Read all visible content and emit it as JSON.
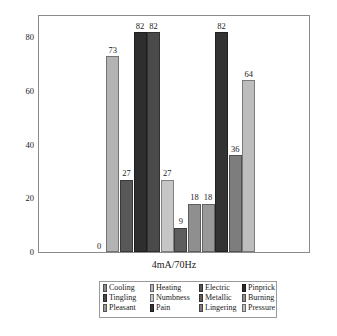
{
  "chart_data": {
    "type": "bar",
    "title": "",
    "subtitle": "",
    "xlabel": "4mA/70Hz",
    "ylabel": "Percentage",
    "categories": [
      "4mA/70Hz"
    ],
    "ylim": [
      0,
      88
    ],
    "yticks": [
      0,
      20,
      40,
      60,
      80
    ],
    "ytick_labels": [
      "0",
      "20",
      "40",
      "60",
      "80"
    ],
    "grid": false,
    "legend_position": "bottom",
    "legend_columns": 4,
    "legend_rows": 3,
    "series": [
      {
        "name": "Cooling",
        "values": [
          0
        ],
        "label": "0",
        "color": "#8c8c8c"
      },
      {
        "name": "Heating",
        "values": [
          73
        ],
        "label": "73",
        "color": "#b3b3b3"
      },
      {
        "name": "Electric",
        "values": [
          27
        ],
        "label": "27",
        "color": "#585858"
      },
      {
        "name": "Pinprick",
        "values": [
          82
        ],
        "label": "82",
        "color": "#2e2e2e"
      },
      {
        "name": "Tingling",
        "values": [
          82
        ],
        "label": "82",
        "color": "#4a4a4a"
      },
      {
        "name": "Numbness",
        "values": [
          27
        ],
        "label": "27",
        "color": "#c6c6c6"
      },
      {
        "name": "Metallic",
        "values": [
          9
        ],
        "label": "9",
        "color": "#5e5e5e"
      },
      {
        "name": "Burning",
        "values": [
          18
        ],
        "label": "18",
        "color": "#8f8f8f"
      },
      {
        "name": "Pleasant",
        "values": [
          18
        ],
        "label": "18",
        "color": "#999999"
      },
      {
        "name": "Pain",
        "values": [
          82
        ],
        "label": "82",
        "color": "#333333"
      },
      {
        "name": "Lingering",
        "values": [
          36
        ],
        "label": "36",
        "color": "#7d7d7d"
      },
      {
        "name": "Pressure",
        "values": [
          64
        ],
        "label": "64",
        "color": "#bdbdbd"
      }
    ]
  },
  "axes": {
    "ylabel": "Percentage",
    "xlabel": "4mA/70Hz",
    "yticks": [
      "0",
      "20",
      "40",
      "60",
      "80"
    ]
  },
  "legend": {
    "rows": [
      [
        {
          "label": "Cooling",
          "color": "#8c8c8c"
        },
        {
          "label": "Heating",
          "color": "#b3b3b3"
        },
        {
          "label": "Electric",
          "color": "#585858"
        },
        {
          "label": "Pinprick",
          "color": "#2e2e2e"
        }
      ],
      [
        {
          "label": "Tingling",
          "color": "#4a4a4a"
        },
        {
          "label": "Numbness",
          "color": "#c6c6c6"
        },
        {
          "label": "Metallic",
          "color": "#5e5e5e"
        },
        {
          "label": "Burning",
          "color": "#8f8f8f"
        }
      ],
      [
        {
          "label": "Pleasant",
          "color": "#999999"
        },
        {
          "label": "Pain",
          "color": "#333333"
        },
        {
          "label": "Lingering",
          "color": "#7d7d7d"
        },
        {
          "label": "Pressure",
          "color": "#bdbdbd"
        }
      ]
    ]
  }
}
